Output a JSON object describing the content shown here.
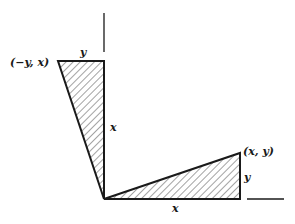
{
  "diagram": {
    "type": "rotation-by-90-degrees",
    "labels": {
      "rotated_point": "(−y, x)",
      "original_point": "(x, y)",
      "top_side_y": "y",
      "vertical_side_x": "x",
      "bottom_side_x": "x",
      "right_side_y": "y"
    },
    "colors": {
      "stroke": "#1a1a1a",
      "hatch": "#333333",
      "background": "#ffffff"
    }
  }
}
